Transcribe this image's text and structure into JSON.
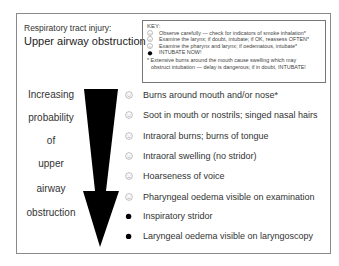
{
  "header": {
    "subtitle": "Respiratory tract injury:",
    "title": "Upper airway obstruction"
  },
  "key": {
    "title": "KEY:",
    "entries": [
      {
        "icon": "smiley-face-icon",
        "label": "Observe carefully — check for indicators of smoke inhalation*"
      },
      {
        "icon": "neutral-face-icon",
        "label": "Examine the larynx; if doubt, intubate; if OK, reassess OFTEN*"
      },
      {
        "icon": "frown-face-icon",
        "label": "Examine the pharynx and larynx; if oedematous, intubate*"
      },
      {
        "icon": "black-dot-icon",
        "label": "INTUBATE NOW!"
      }
    ],
    "note_line1": "* Extensive burns around the mouth cause swelling which may",
    "note_line2": "obstruct intubation — delay is dangerous; if in doubt, INTUBATE!"
  },
  "left_labels": [
    "Increasing",
    "probability",
    "of",
    "upper",
    "airway",
    "obstruction"
  ],
  "arrow": {
    "direction": "down",
    "color": "#000000"
  },
  "items": [
    {
      "icon": "smiley-face-icon",
      "label": "Burns around mouth and/or nose*"
    },
    {
      "icon": "smiley-face-icon",
      "label": "Soot in mouth or nostrils; singed nasal hairs"
    },
    {
      "icon": "neutral-face-icon",
      "label": "Intraoral burns; burns of tongue"
    },
    {
      "icon": "neutral-face-icon",
      "label": "Intraoral swelling (no stridor)"
    },
    {
      "icon": "frown-face-icon",
      "label": "Hoarseness of voice"
    },
    {
      "icon": "frown-face-icon",
      "label": "Pharyngeal oedema visible on examination"
    },
    {
      "icon": "black-dot-icon",
      "label": "Inspiratory stridor"
    },
    {
      "icon": "black-dot-icon",
      "label": "Laryngeal oedema visible on laryngoscopy"
    }
  ]
}
